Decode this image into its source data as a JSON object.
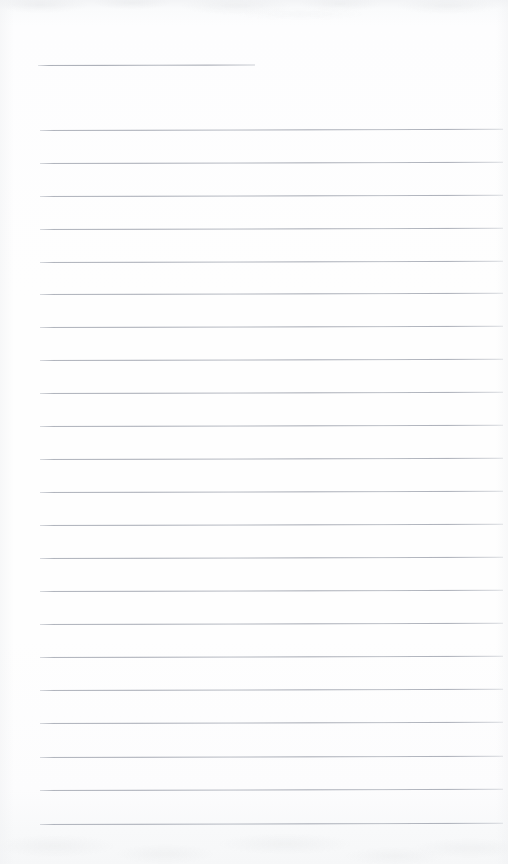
{
  "document": {
    "type": "lined-notepad-page",
    "title": "Blank lined notepad page",
    "description": "Scanned blank ruled writing paper with a short header rule and full-width ruled lines",
    "page_width": 508,
    "page_height": 864,
    "text_content": "",
    "is_blank": true
  },
  "paper": {
    "background_color": "#fdfdfe",
    "edge_tint_color": "#f3f4f6",
    "noise_color": "#9699a0"
  },
  "ruling": {
    "line_color": "#a6aab4",
    "line_thickness_px": 1,
    "line_spacing_px": 32.5,
    "left_margin_px": 40,
    "right_edge_px": 503,
    "tilt_degrees": -0.14,
    "full_rule_count": 22,
    "header_rule": {
      "label": "header-rule",
      "y": 65,
      "x_start": 38,
      "x_end": 255,
      "width_px": 217
    },
    "rules": [
      {
        "label": "rule-1",
        "y": 130,
        "x_start": 40,
        "width_px": 463
      },
      {
        "label": "rule-2",
        "y": 163,
        "x_start": 40,
        "width_px": 463
      },
      {
        "label": "rule-3",
        "y": 196,
        "x_start": 40,
        "width_px": 463
      },
      {
        "label": "rule-4",
        "y": 229,
        "x_start": 40,
        "width_px": 463
      },
      {
        "label": "rule-5",
        "y": 262,
        "x_start": 40,
        "width_px": 463
      },
      {
        "label": "rule-6",
        "y": 294,
        "x_start": 40,
        "width_px": 463
      },
      {
        "label": "rule-7",
        "y": 327,
        "x_start": 40,
        "width_px": 463
      },
      {
        "label": "rule-8",
        "y": 360,
        "x_start": 40,
        "width_px": 463
      },
      {
        "label": "rule-9",
        "y": 393,
        "x_start": 40,
        "width_px": 463
      },
      {
        "label": "rule-10",
        "y": 426,
        "x_start": 40,
        "width_px": 463
      },
      {
        "label": "rule-11",
        "y": 459,
        "x_start": 40,
        "width_px": 463
      },
      {
        "label": "rule-12",
        "y": 492,
        "x_start": 40,
        "width_px": 463
      },
      {
        "label": "rule-13",
        "y": 525,
        "x_start": 40,
        "width_px": 463
      },
      {
        "label": "rule-14",
        "y": 558,
        "x_start": 40,
        "width_px": 463
      },
      {
        "label": "rule-15",
        "y": 591,
        "x_start": 40,
        "width_px": 463
      },
      {
        "label": "rule-16",
        "y": 624,
        "x_start": 40,
        "width_px": 463
      },
      {
        "label": "rule-17",
        "y": 657,
        "x_start": 40,
        "width_px": 463
      },
      {
        "label": "rule-18",
        "y": 690,
        "x_start": 40,
        "width_px": 463
      },
      {
        "label": "rule-19",
        "y": 723,
        "x_start": 40,
        "width_px": 463
      },
      {
        "label": "rule-20",
        "y": 757,
        "x_start": 40,
        "width_px": 463
      },
      {
        "label": "rule-21",
        "y": 790,
        "x_start": 40,
        "width_px": 463
      },
      {
        "label": "rule-22",
        "y": 824,
        "x_start": 40,
        "width_px": 463
      }
    ]
  }
}
